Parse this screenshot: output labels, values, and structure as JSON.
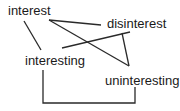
{
  "diagram": {
    "nodes": [
      {
        "id": "interest",
        "label": "interest"
      },
      {
        "id": "disinterest",
        "label": "disinterest"
      },
      {
        "id": "interesting",
        "label": "interesting"
      },
      {
        "id": "uninteresting",
        "label": "uninteresting"
      }
    ],
    "edges": [
      {
        "from": "interest",
        "to": "interesting",
        "style": "straight"
      },
      {
        "from": "interest",
        "to": "disinterest",
        "style": "straight"
      },
      {
        "from": "interest",
        "to": "uninteresting",
        "style": "straight"
      },
      {
        "from": "interesting",
        "to": "disinterest",
        "style": "straight"
      },
      {
        "from": "disinterest",
        "to": "uninteresting",
        "style": "straight"
      },
      {
        "from": "interesting",
        "to": "uninteresting",
        "style": "bracket"
      }
    ],
    "colors": {
      "line": "#2a2a2a",
      "text": "#1a1a1a",
      "background": "#ffffff"
    }
  }
}
